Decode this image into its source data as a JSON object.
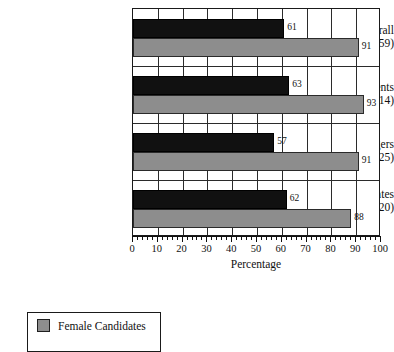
{
  "chart_data": {
    "type": "bar",
    "orientation": "horizontal",
    "title": "",
    "xlabel": "Percentage",
    "ylabel": "",
    "xlim": [
      0,
      100
    ],
    "xticks": [
      0,
      10,
      20,
      30,
      40,
      50,
      60,
      70,
      80,
      90,
      100
    ],
    "xtick_labels": [
      "0",
      "10",
      "20",
      "30",
      "40",
      "50",
      "60",
      "70",
      "80",
      "90",
      "100"
    ],
    "minor_tick_step": 2,
    "grid": "vertical-major-and-group-separators",
    "categories": [
      "Overall",
      "Incumbents",
      "Challengers",
      "Open Race Candidates"
    ],
    "category_subtitles": [
      "(231;59)",
      "(79;14)",
      "(54;25)",
      "(98;20)"
    ],
    "series": [
      {
        "name": "Male Candidates",
        "color": "#111111",
        "values": [
          61,
          63,
          57,
          62
        ],
        "labels": [
          "61",
          "63",
          "57",
          "62"
        ]
      },
      {
        "name": "Female Candidates",
        "color": "#8d8d8d",
        "values": [
          91,
          93,
          91,
          88
        ],
        "labels": [
          "91",
          "93",
          "91",
          "88"
        ]
      }
    ],
    "legend": {
      "position": "below-left",
      "entries": [
        {
          "label": "Female Candidates",
          "color": "#8d8d8d"
        }
      ]
    }
  },
  "axis": {
    "x_title": "Percentage"
  },
  "legend": {
    "female_label": "Female Candidates"
  }
}
